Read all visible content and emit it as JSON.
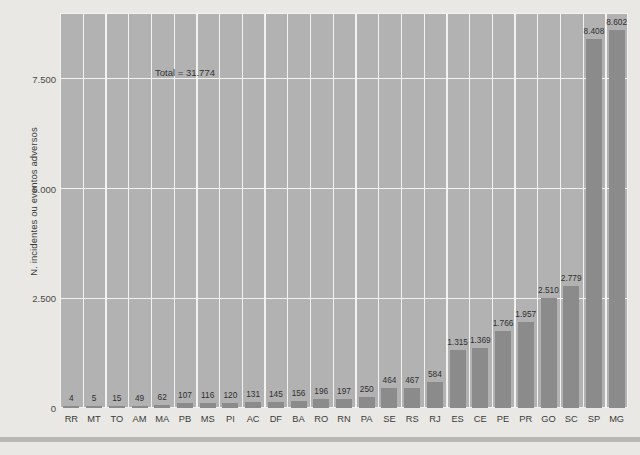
{
  "chart_data": {
    "type": "bar",
    "title": "",
    "xlabel": "",
    "ylabel": "N. incidentes ou eventos adversos",
    "categories": [
      "RR",
      "MT",
      "TO",
      "AM",
      "MA",
      "PB",
      "MS",
      "PI",
      "AC",
      "DF",
      "BA",
      "RO",
      "RN",
      "PA",
      "SE",
      "RS",
      "RJ",
      "ES",
      "CE",
      "PE",
      "PR",
      "GO",
      "SC",
      "SP",
      "MG"
    ],
    "values": [
      4,
      5,
      15,
      49,
      62,
      107,
      116,
      120,
      131,
      145,
      156,
      196,
      197,
      250,
      464,
      467,
      584,
      1315,
      1369,
      1766,
      1957,
      2510,
      2779,
      8408,
      8602
    ],
    "value_labels": [
      "4",
      "5",
      "15",
      "49",
      "62",
      "107",
      "116",
      "120",
      "131",
      "145",
      "156",
      "196",
      "197",
      "250",
      "464",
      "467",
      "584",
      "1.315",
      "1.369",
      "1.766",
      "1.957",
      "2.510",
      "2.779",
      "8.408",
      "8.602"
    ],
    "ylim": [
      0,
      9000
    ],
    "yticks": [
      0,
      2500,
      5000,
      7500
    ],
    "ytick_labels": [
      "0",
      "2.500",
      "5.000",
      "7.500"
    ],
    "grid": true,
    "legend": "none",
    "annotations": [
      {
        "text": "Total = 31.774",
        "x": 0.06,
        "y": 0.89
      }
    ],
    "colors": {
      "bar": "#8b8b8b",
      "plot_background": "#b2b2b2",
      "figure_background": "#e9e8e4",
      "gridline": "#f2f2f0",
      "text": "#3a3a3a"
    }
  }
}
